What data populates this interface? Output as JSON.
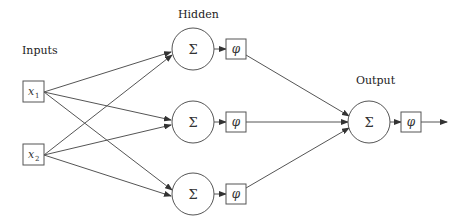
{
  "diagram": {
    "type": "neural-network",
    "layers": {
      "inputs": {
        "label": "Inputs",
        "nodes": [
          {
            "id": "x1",
            "var": "x",
            "sub": "1",
            "cx": 33,
            "cy": 92
          },
          {
            "id": "x2",
            "var": "x",
            "sub": "2",
            "cx": 33,
            "cy": 155
          }
        ]
      },
      "hidden": {
        "label": "Hidden",
        "nodes": [
          {
            "id": "h1",
            "sum": "Σ",
            "act": "φ",
            "cx": 193,
            "cy": 49
          },
          {
            "id": "h2",
            "sum": "Σ",
            "act": "φ",
            "cx": 193,
            "cy": 122
          },
          {
            "id": "h3",
            "sum": "Σ",
            "act": "φ",
            "cx": 193,
            "cy": 194
          }
        ]
      },
      "output": {
        "label": "Output",
        "nodes": [
          {
            "id": "o1",
            "sum": "Σ",
            "act": "φ",
            "cx": 369,
            "cy": 122
          }
        ]
      }
    },
    "edges": [
      [
        "x1",
        "h1"
      ],
      [
        "x1",
        "h2"
      ],
      [
        "x1",
        "h3"
      ],
      [
        "x2",
        "h1"
      ],
      [
        "x2",
        "h2"
      ],
      [
        "x2",
        "h3"
      ],
      [
        "h1",
        "o1"
      ],
      [
        "h2",
        "o1"
      ],
      [
        "h3",
        "o1"
      ]
    ],
    "colors": {
      "stroke": "#555555",
      "text": "#222222",
      "background": "#ffffff"
    }
  }
}
